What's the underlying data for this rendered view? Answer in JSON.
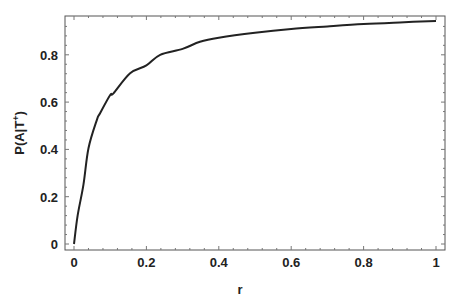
{
  "chart_data": {
    "type": "line",
    "title": "",
    "xlabel": "r",
    "ylabel": "P(A|T⁺)",
    "ylabel_parts": {
      "main": "P(A|T",
      "sup": "+",
      "close": ")"
    },
    "xlim": [
      -0.025,
      1.025
    ],
    "ylim": [
      -0.025,
      0.96
    ],
    "xticks": [
      0,
      0.2,
      0.4,
      0.6,
      0.8,
      1
    ],
    "xtick_labels": [
      "0",
      "0.2",
      "0.4",
      "0.6",
      "0.8",
      "1"
    ],
    "yticks": [
      0,
      0.2,
      0.4,
      0.6,
      0.8
    ],
    "ytick_labels": [
      "0",
      "0.2",
      "0.4",
      "0.6",
      "0.8"
    ],
    "grid": false,
    "legend": null,
    "line_color": "#222222",
    "series": [
      {
        "name": "P(A|T+)",
        "x": [
          0,
          0.01,
          0.026,
          0.04,
          0.063,
          0.072,
          0.1,
          0.109,
          0.155,
          0.2,
          0.238,
          0.3,
          0.348,
          0.4,
          0.5,
          0.6,
          0.7,
          0.8,
          0.9,
          1.0
        ],
        "y": [
          0,
          0.12,
          0.25,
          0.405,
          0.524,
          0.553,
          0.63,
          0.637,
          0.722,
          0.755,
          0.8,
          0.825,
          0.855,
          0.872,
          0.893,
          0.909,
          0.92,
          0.93,
          0.937,
          0.943
        ]
      }
    ]
  }
}
